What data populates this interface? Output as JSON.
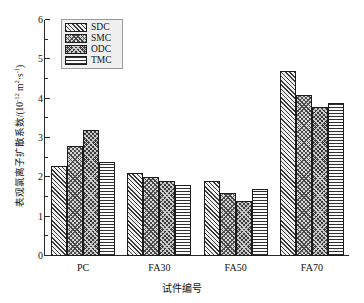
{
  "chart_data": {
    "type": "bar",
    "title": "",
    "subtitle": "",
    "xlabel": "试件编号",
    "ylabel": "表观氯离子扩散系数/(10⁻¹² m²·s⁻¹)",
    "ylabel_main": "表观氯离子扩散系数/(10",
    "ylabel_exp": "-12",
    "ylabel_unit_mid": " m",
    "ylabel_unit_sup1": "2",
    "ylabel_unit_dot": "·s",
    "ylabel_unit_sup2": "-1",
    "ylabel_unit_end": ")",
    "categories": [
      "PC",
      "FA30",
      "FA50",
      "FA70"
    ],
    "series": [
      {
        "name": "SDC",
        "values": [
          2.3,
          2.1,
          1.9,
          4.7
        ],
        "pattern": "diagonal-hatch"
      },
      {
        "name": "SMC",
        "values": [
          2.8,
          2.0,
          1.6,
          4.1
        ],
        "pattern": "cross-hatch"
      },
      {
        "name": "ODC",
        "values": [
          3.2,
          1.9,
          1.4,
          3.8
        ],
        "pattern": "dark-cross-hatch"
      },
      {
        "name": "TMC",
        "values": [
          2.4,
          1.8,
          1.7,
          3.9
        ],
        "pattern": "horizontal-lines"
      }
    ],
    "ylim": [
      0,
      6
    ],
    "ytick_labels": [
      "0",
      "1",
      "2",
      "3",
      "4",
      "5",
      "6"
    ],
    "ytick_values": [
      0,
      1,
      2,
      3,
      4,
      5,
      6
    ],
    "yminor_values": [
      0.5,
      1.5,
      2.5,
      3.5,
      4.5,
      5.5
    ],
    "grid": false,
    "legend_position": "top-left",
    "axis_color": "#2a2a2a",
    "bar_border_color": "#1c1c1c"
  },
  "legend": {
    "items": [
      {
        "label": "SDC"
      },
      {
        "label": "SMC"
      },
      {
        "label": "ODC"
      },
      {
        "label": "TMC"
      }
    ]
  }
}
